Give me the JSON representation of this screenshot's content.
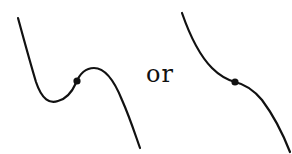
{
  "figure": {
    "connector_text": "or",
    "stroke_color": "#111111",
    "background_color": "#ffffff",
    "panels": [
      {
        "id": "left",
        "description": "cubic curve with local minimum and local maximum; inflection point marked with a dot",
        "has_local_extrema": true,
        "inflection_point_marked": true
      },
      {
        "id": "right",
        "description": "monotonically decreasing cubic curve with a horizontal-tangent inflection point marked with a dot",
        "has_local_extrema": false,
        "inflection_point_marked": true
      }
    ]
  }
}
